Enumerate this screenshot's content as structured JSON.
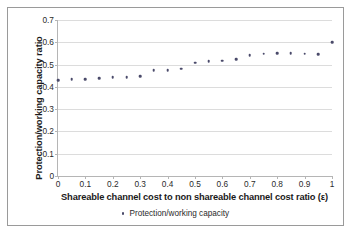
{
  "chart_data": {
    "type": "scatter",
    "title": "",
    "xlabel": "Shareable channel cost to non shareable channel cost ratio (ε)",
    "ylabel": "Protection/working capacity ratio",
    "xlim": [
      0,
      1
    ],
    "ylim": [
      0,
      0.7
    ],
    "grid": true,
    "legend_position": "bottom",
    "xticks": [
      "0",
      "0.1",
      "0.2",
      "0.3",
      "0.4",
      "0.5",
      "0.6",
      "0.7",
      "0.8",
      "0.9",
      "1"
    ],
    "xtick_values": [
      0,
      0.1,
      0.2,
      0.3,
      0.4,
      0.5,
      0.6,
      0.7,
      0.8,
      0.9,
      1
    ],
    "yticks": [
      "0",
      "0.1",
      "0.2",
      "0.3",
      "0.4",
      "0.5",
      "0.6",
      "0.7"
    ],
    "ytick_values": [
      0,
      0.1,
      0.2,
      0.3,
      0.4,
      0.5,
      0.6,
      0.7
    ],
    "series": [
      {
        "name": "Protection/working capacity",
        "marker": "dot",
        "color": "#4a4a6a",
        "x": [
          0,
          0.05,
          0.1,
          0.15,
          0.2,
          0.25,
          0.3,
          0.35,
          0.4,
          0.45,
          0.5,
          0.55,
          0.6,
          0.65,
          0.7,
          0.75,
          0.8,
          0.85,
          0.9,
          0.95,
          1
        ],
        "values": [
          0.43,
          0.435,
          0.435,
          0.438,
          0.442,
          0.443,
          0.448,
          0.474,
          0.475,
          0.481,
          0.508,
          0.516,
          0.518,
          0.523,
          0.541,
          0.548,
          0.551,
          0.551,
          0.548,
          0.547,
          0.6
        ]
      }
    ]
  },
  "legend": {
    "items": [
      {
        "label": "Protection/working capacity"
      }
    ]
  }
}
